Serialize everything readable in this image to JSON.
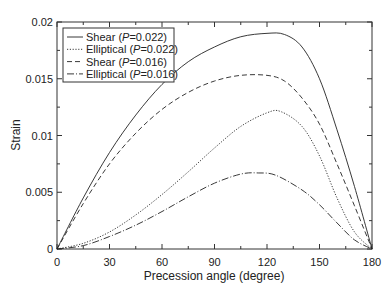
{
  "chart_data": {
    "type": "line",
    "title": "",
    "xlabel": "Precession angle (degree)",
    "ylabel": "Strain",
    "xlim": [
      0,
      180
    ],
    "ylim": [
      0,
      0.02
    ],
    "xticks": [
      0,
      30,
      60,
      90,
      120,
      150,
      180
    ],
    "xtick_labels": [
      "0",
      "30",
      "60",
      "90",
      "120",
      "150",
      "180"
    ],
    "yticks": [
      0,
      0.005,
      0.01,
      0.015,
      0.02
    ],
    "ytick_labels": [
      "0",
      "0.005",
      "0.01",
      "0.015",
      "0.02"
    ],
    "grid": false,
    "legend_position": "upper left",
    "series": [
      {
        "name": "Shear (P=0.022)",
        "label_prefix": "Shear (",
        "label_italic": "P",
        "label_suffix": "=0.022)",
        "style": "solid",
        "x": [
          0,
          15,
          30,
          45,
          60,
          75,
          90,
          105,
          120,
          130,
          140,
          150,
          160,
          170,
          180
        ],
        "y": [
          0,
          0.0045,
          0.0085,
          0.0118,
          0.0145,
          0.0165,
          0.0178,
          0.0187,
          0.019,
          0.0189,
          0.0178,
          0.015,
          0.0105,
          0.0055,
          0
        ]
      },
      {
        "name": "Elliptical (P=0.022)",
        "label_prefix": "Elliptical (",
        "label_italic": "P",
        "label_suffix": "=0.022)",
        "style": "dotted",
        "x": [
          0,
          15,
          30,
          45,
          60,
          75,
          90,
          105,
          120,
          128,
          140,
          150,
          160,
          170,
          180
        ],
        "y": [
          0,
          0.0005,
          0.0015,
          0.003,
          0.0048,
          0.0068,
          0.0089,
          0.0108,
          0.012,
          0.0121,
          0.0108,
          0.0082,
          0.0045,
          0.0015,
          0
        ]
      },
      {
        "name": "Shear (P=0.016)",
        "label_prefix": "Shear (",
        "label_italic": "P",
        "label_suffix": "=0.016)",
        "style": "dashed",
        "x": [
          0,
          15,
          30,
          45,
          60,
          75,
          90,
          105,
          120,
          130,
          140,
          150,
          160,
          170,
          180
        ],
        "y": [
          0,
          0.004,
          0.0075,
          0.0102,
          0.0123,
          0.0138,
          0.0148,
          0.0153,
          0.0153,
          0.0148,
          0.0133,
          0.011,
          0.0075,
          0.0038,
          0
        ]
      },
      {
        "name": "Elliptical (P=0.016)",
        "label_prefix": "Elliptical (",
        "label_italic": "P",
        "label_suffix": "=0.016)",
        "style": "dashdot",
        "x": [
          0,
          15,
          30,
          45,
          60,
          75,
          90,
          105,
          115,
          125,
          140,
          150,
          160,
          170,
          180
        ],
        "y": [
          0,
          0.0003,
          0.0011,
          0.0021,
          0.0033,
          0.0046,
          0.0058,
          0.0066,
          0.0067,
          0.0065,
          0.0052,
          0.0039,
          0.0023,
          0.0008,
          0
        ]
      }
    ]
  }
}
